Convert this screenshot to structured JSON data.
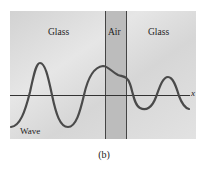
{
  "figure": {
    "caption": "(b)",
    "regions": [
      {
        "name": "glass-left",
        "label": "Glass"
      },
      {
        "name": "air",
        "label": "Air"
      },
      {
        "name": "glass-right",
        "label": "Glass"
      }
    ],
    "wave_label": "Wave",
    "axis_label": "x",
    "colors": {
      "glass_background": "#d9d9d9",
      "air_background": "#b8b8b8",
      "wave_stroke": "#4a4a4a",
      "axis_stroke": "#333333",
      "boundary_stroke": "#444444"
    }
  }
}
